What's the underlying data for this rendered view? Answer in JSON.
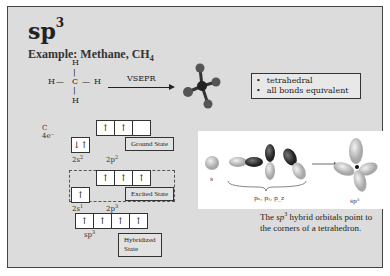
{
  "slide": {
    "title_main": "sp",
    "title_sup": "3",
    "example_prefix": "Example: Methane, CH",
    "example_sub": "4"
  },
  "lewis_structure": {
    "top": "H",
    "left": "H",
    "center": "C",
    "right": "H",
    "bottom": "H",
    "bond_h": "—",
    "bond_v": "|"
  },
  "vsepr": {
    "label": "VSEPR",
    "arrow": "arrow-right"
  },
  "bullets": {
    "items": [
      "tetrahedral",
      "all bonds equivalent"
    ]
  },
  "carbon": {
    "symbol": "C",
    "electrons": "4e⁻"
  },
  "ground_state": {
    "label": "Ground State",
    "s_boxes": [
      "↓↑"
    ],
    "p_boxes": [
      "↑",
      "↑",
      ""
    ],
    "s_label": "2s",
    "s_sup": "2",
    "p_label": "2p",
    "p_sup": "2"
  },
  "excited_state": {
    "label": "Excited State",
    "s_boxes": [
      "↑"
    ],
    "p_boxes": [
      "↑",
      "↑",
      "↑"
    ],
    "s_label": "2s",
    "s_sup": "1",
    "p_label": "2p",
    "p_sup": "3"
  },
  "hybridized_state": {
    "label_line1": "Hybridized",
    "label_line2": "State",
    "boxes": [
      "↑",
      "↑",
      "↑",
      "↑"
    ],
    "orbital_label": "sp",
    "orbital_sup": "3"
  },
  "figure": {
    "s_label": "s",
    "p_label": "pₓ, pᵧ, p_z",
    "sp3_label": "sp³"
  },
  "caption": {
    "part1": "The ",
    "italic": "sp",
    "sup": "3",
    "part2": " hybrid orbitals point to the corners of a tetrahedron."
  },
  "colors": {
    "slide_bg": "#dcdcdc",
    "text": "#222222",
    "orbital_dark": "#333333",
    "orbital_light": "#cfcfcf"
  }
}
